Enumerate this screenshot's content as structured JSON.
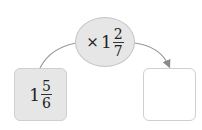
{
  "operator": {
    "symbol": "×",
    "whole": "1",
    "numerator": "2",
    "denominator": "7"
  },
  "start_value": {
    "whole": "1",
    "numerator": "5",
    "denominator": "6"
  },
  "result_value": {
    "text": ""
  },
  "colors": {
    "fill": "#e6e6e6",
    "stroke": "#c4c4c4",
    "arrow": "#8a8a8a"
  }
}
